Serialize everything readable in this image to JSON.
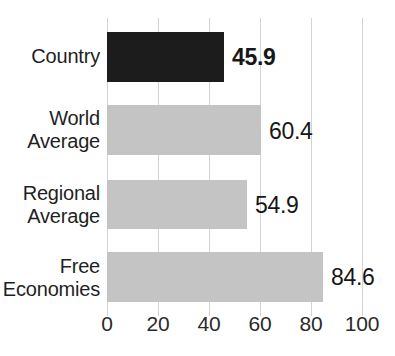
{
  "chart_data": {
    "type": "bar",
    "orientation": "horizontal",
    "title": "",
    "title_note": "title is cropped off the top edge of the screenshot and is not legible",
    "xlabel": "",
    "ylabel": "",
    "categories": [
      "Country",
      "World Average",
      "Regional Average",
      "Free Economies"
    ],
    "values": [
      45.9,
      60.4,
      54.9,
      84.6
    ],
    "value_labels": [
      "45.9",
      "60.4",
      "54.9",
      "84.6"
    ],
    "xlim": [
      0,
      100
    ],
    "xticks": [
      0,
      20,
      40,
      60,
      80,
      100
    ],
    "xtick_labels": [
      "0",
      "20",
      "40",
      "60",
      "80",
      "100"
    ],
    "grid": true,
    "grid_axis": "x",
    "legend": "none",
    "highlighted_category": "Country",
    "bar_colors": [
      "#1c1c1c",
      "#c4c4c4",
      "#c4c4c4",
      "#c4c4c4"
    ],
    "grid_color": "#d3d3d3",
    "label_color": "#1f1f1f",
    "bars": [
      {
        "label_lines": [
          "Country"
        ],
        "value": 45.9,
        "value_text": "45.9",
        "color": "#1c1c1c",
        "emphasis": true
      },
      {
        "label_lines": [
          "World",
          "Average"
        ],
        "value": 60.4,
        "value_text": "60.4",
        "color": "#c4c4c4",
        "emphasis": false
      },
      {
        "label_lines": [
          "Regional",
          "Average"
        ],
        "value": 54.9,
        "value_text": "54.9",
        "color": "#c4c4c4",
        "emphasis": false
      },
      {
        "label_lines": [
          "Free",
          "Economies"
        ],
        "value": 84.6,
        "value_text": "84.6",
        "color": "#c4c4c4",
        "emphasis": false
      }
    ]
  }
}
